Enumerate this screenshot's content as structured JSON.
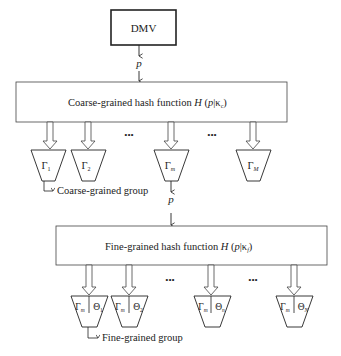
{
  "diagram": {
    "source_node": {
      "label": "DMV"
    },
    "packet_label": "p",
    "coarse_hash": {
      "label_prefix": "Coarse-grained hash function ",
      "func": "H",
      "arg": "p",
      "key": "κ",
      "key_sub": "c"
    },
    "coarse_groups": [
      {
        "sym": "Γ",
        "sub": "1"
      },
      {
        "sym": "Γ",
        "sub": "2"
      },
      {
        "sym": "Γ",
        "sub": "m"
      },
      {
        "sym": "Γ",
        "sub": "M"
      }
    ],
    "coarse_group_caption": "Coarse-grained group",
    "ellipsis": "•••",
    "fine_hash": {
      "label_prefix": "Fine-grained hash function ",
      "func": "H",
      "arg": "p",
      "key": "κ",
      "key_sub": "f"
    },
    "fine_groups": [
      {
        "left": "Γ",
        "left_sub": "m",
        "right": "Θ",
        "right_sub": "1"
      },
      {
        "left": "Γ",
        "left_sub": "m",
        "right": "Θ",
        "right_sub": "2"
      },
      {
        "left": "Γ",
        "left_sub": "m",
        "right": "Θ",
        "right_sub": "n"
      },
      {
        "left": "Γ",
        "left_sub": "m",
        "right": "Θ",
        "right_sub": "N"
      }
    ],
    "fine_group_caption": "Fine-grained group"
  }
}
